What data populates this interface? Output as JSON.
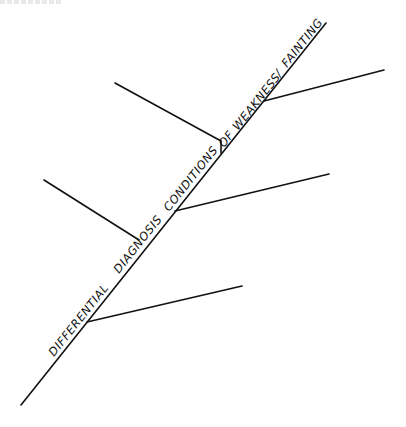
{
  "diagram": {
    "type": "fishbone",
    "title_along_spine": "DIFFERENTIAL DIAGNOSIS CONDITIONS OF WEAKNESS / FAINTING",
    "spine_words": [
      {
        "text": "DIFFERENTIAL"
      },
      {
        "text": "DIAGNOSIS"
      },
      {
        "text": "CONDITIONS"
      },
      {
        "text": "OF"
      },
      {
        "text": "WEAKNESS"
      },
      {
        "text": "/"
      },
      {
        "text": "FAINTING"
      }
    ],
    "branches": [
      {
        "side": "upper-left",
        "label": ""
      },
      {
        "side": "upper-right",
        "label": ""
      },
      {
        "side": "middle-left",
        "label": ""
      },
      {
        "side": "middle-right",
        "label": ""
      },
      {
        "side": "lower-right",
        "label": ""
      }
    ],
    "line_color": "#111111",
    "background_color": "#ffffff"
  }
}
